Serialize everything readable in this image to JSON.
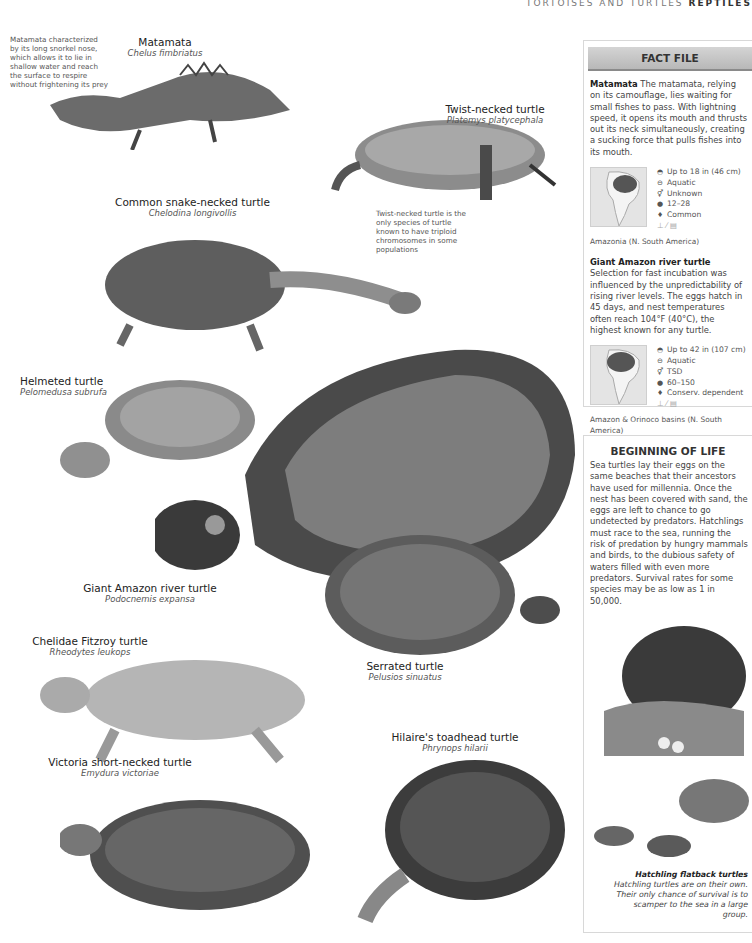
{
  "running_head": {
    "section": "TORTOISES AND TURTLES",
    "title": "REPTILES"
  },
  "notes": {
    "matamata": "Matamata characterized by its long snorkel nose, which allows it to lie in shallow water and reach the surface to respire without frightening its prey",
    "twist_necked": "Twist-necked turtle is the only species of turtle known to have triploid chromosomes in some populations"
  },
  "species": [
    {
      "common": "Matamata",
      "scientific": "Chelus fimbriatus"
    },
    {
      "common": "Twist-necked turtle",
      "scientific": "Platemys platycephala"
    },
    {
      "common": "Common snake-necked turtle",
      "scientific": "Chelodina longivollis"
    },
    {
      "common": "Helmeted turtle",
      "scientific": "Pelomedusa subrufa"
    },
    {
      "common": "Giant Amazon river turtle",
      "scientific": "Podocnemis expansa"
    },
    {
      "common": "Serrated turtle",
      "scientific": "Pelusios sinuatus"
    },
    {
      "common": "Chelidae Fitzroy turtle",
      "scientific": "Rheodytes leukops"
    },
    {
      "common": "Hilaire's toadhead turtle",
      "scientific": "Phrynops hilarii"
    },
    {
      "common": "Victoria short-necked turtle",
      "scientific": "Emydura victoriae"
    }
  ],
  "fact_file": {
    "title": "FACT FILE",
    "entries": [
      {
        "name": "Matamata",
        "text": "The matamata, relying on its camouflage, lies waiting for small fishes to pass. With lightning speed, it opens its mouth and thrusts out its neck simultaneously, creating a sucking force that pulls fishes into its mouth.",
        "stats": {
          "size": "Up to 18 in (46 cm)",
          "habitat": "Aquatic",
          "sex": "Unknown",
          "eggs": "12–28",
          "status": "Common"
        },
        "region": "Amazonia (N. South America)"
      },
      {
        "name": "Giant Amazon river turtle",
        "text": "Selection for fast incubation was influenced by the unpredictability of rising river levels. The eggs hatch in 45 days, and nest temperatures often reach 104°F (40°C), the highest known for any turtle.",
        "stats": {
          "size": "Up to 42 in (107 cm)",
          "habitat": "Aquatic",
          "sex": "TSD",
          "eggs": "60–150",
          "status": "Conserv. dependent"
        },
        "region": "Amazon & Orinoco basins (N. South America)"
      }
    ]
  },
  "beginning_of_life": {
    "title": "BEGINNING OF LIFE",
    "text": "Sea turtles lay their eggs on the same beaches that their ancestors have used for millennia. Once the nest has been covered with sand, the eggs are left to chance to go undetected by predators. Hatchlings must race to the sea, running the risk of predation by hungry mammals and birds, to the dubious safety of waters filled with even more predators. Survival rates for some species may be as low as 1 in 50,000.",
    "caption_title": "Hatchling flatback turtles",
    "caption_text": "Hatchling turtles are on their own. Their only chance of survival is to scamper to the sea in a large group."
  },
  "icons": {
    "size": "turtle-size-icon",
    "habitat": "water-icon",
    "sex": "sex-icon",
    "eggs": "egg-icon",
    "status": "status-icon"
  }
}
